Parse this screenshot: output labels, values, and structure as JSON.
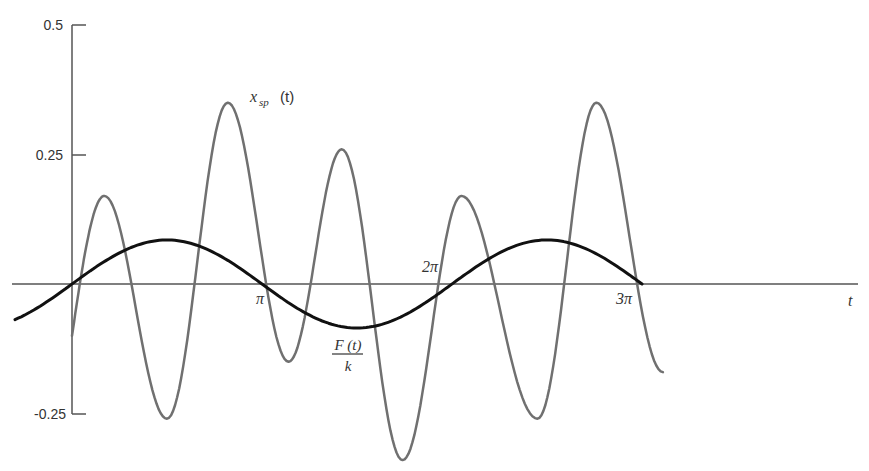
{
  "chart_data": {
    "type": "line",
    "title": "",
    "xlabel": "t",
    "ylabel": "",
    "xlim": [
      -0.3,
      3.3
    ],
    "xlim_units": "multiples of pi",
    "ylim": [
      -0.25,
      0.5
    ],
    "grid": false,
    "legend": "inline labels",
    "y_ticks": [
      {
        "value": 0.5,
        "label": "0.5"
      },
      {
        "value": 0.25,
        "label": "0.25"
      },
      {
        "value": -0.25,
        "label": "-0.25"
      }
    ],
    "x_ticks": [
      {
        "value": 1,
        "label": "π"
      },
      {
        "value": 2,
        "label": "2π"
      },
      {
        "value": 3,
        "label": "3π"
      }
    ],
    "series": [
      {
        "name": "F(t)/k",
        "label_numerator": "F (t)",
        "label_denominator": "k",
        "color": "#111111",
        "stroke_width": 3,
        "description": "Sinusoid with period 2π, amplitude ≈ 0.085, zero crossings at 0, π, 2π, 3π",
        "x": [
          -0.3,
          0,
          0.5,
          1,
          1.5,
          2,
          2.5,
          3
        ],
        "y": [
          -0.07,
          0,
          0.085,
          0,
          -0.085,
          0,
          0.085,
          0
        ]
      },
      {
        "name": "x_sp(t)",
        "label_main": "x",
        "label_sub": "sp",
        "label_suffix": "(t)",
        "color": "#707070",
        "stroke_width": 2.5,
        "description": "Oscillating response; local extrema read from plot",
        "x": [
          0,
          0.17,
          0.5,
          0.82,
          1.14,
          1.42,
          1.74,
          2.05,
          2.45,
          2.76,
          3.11
        ],
        "y": [
          -0.1,
          0.17,
          -0.26,
          0.35,
          -0.15,
          0.26,
          -0.34,
          0.17,
          -0.26,
          0.35,
          -0.17
        ]
      }
    ]
  },
  "labels": {
    "y_tick_top": "0.5",
    "y_tick_mid": "0.25",
    "y_tick_bottom": "-0.25",
    "x_tick_pi": "π",
    "x_tick_2pi": "2π",
    "x_tick_3pi": "3π",
    "x_axis_label": "t",
    "xsp_main": "x",
    "xsp_sub": "sp",
    "xsp_suffix": "(t)",
    "force_numerator": "F (t)",
    "force_denominator": "k"
  },
  "colors": {
    "axis": "#555555",
    "force_curve": "#111111",
    "response_curve": "#707070",
    "text": "#333333"
  }
}
